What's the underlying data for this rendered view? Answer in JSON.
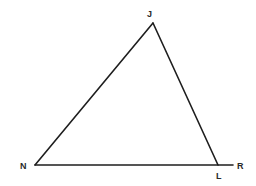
{
  "figure": {
    "type": "geometry",
    "line_color": "#1e1e1e",
    "background": "#ffffff"
  },
  "points": {
    "J": {
      "label": "J",
      "x": 153,
      "y": 23,
      "label_x": 147,
      "label_y": 17
    },
    "N": {
      "label": "N",
      "x": 35,
      "y": 165,
      "label_x": 20,
      "label_y": 169
    },
    "L": {
      "label": "L",
      "x": 218,
      "y": 165,
      "label_x": 216,
      "label_y": 179
    },
    "R": {
      "label": "R",
      "x": 233,
      "y": 165,
      "label_x": 237,
      "label_y": 169
    }
  },
  "segments": [
    {
      "name": "NJ",
      "from": "N",
      "to": "J"
    },
    {
      "name": "JL",
      "from": "J",
      "to": "L"
    },
    {
      "name": "NR",
      "from": "N",
      "to": "R"
    }
  ]
}
